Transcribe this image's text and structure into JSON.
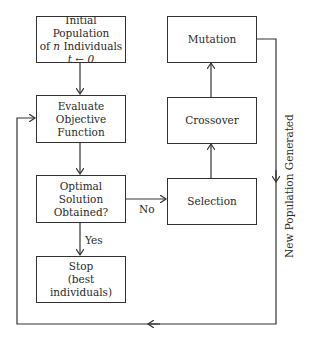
{
  "diagram": {
    "type": "flowchart",
    "nodes": {
      "init": {
        "line1": "Initial Population",
        "line2_prefix": "of ",
        "line2_var": "n",
        "line2_suffix": " Individuals",
        "line3": "t ← 0"
      },
      "evaluate": {
        "line1": "Evaluate Objective",
        "line2": "Function"
      },
      "decision": {
        "line1": "Optimal Solution",
        "line2": "Obtained?"
      },
      "stop": {
        "line1": "Stop",
        "line2": "(best individuals)"
      },
      "selection": {
        "label": "Selection"
      },
      "crossover": {
        "label": "Crossover"
      },
      "mutation": {
        "label": "Mutation"
      }
    },
    "edge_labels": {
      "no": "No",
      "yes": "Yes",
      "loop": "New Population Generated"
    },
    "edges": [
      {
        "from": "init",
        "to": "evaluate"
      },
      {
        "from": "evaluate",
        "to": "decision"
      },
      {
        "from": "decision",
        "to": "stop",
        "label": "Yes"
      },
      {
        "from": "decision",
        "to": "selection",
        "label": "No"
      },
      {
        "from": "selection",
        "to": "crossover"
      },
      {
        "from": "crossover",
        "to": "mutation"
      },
      {
        "from": "mutation",
        "to": "evaluate",
        "label": "New Population Generated"
      }
    ],
    "colors": {
      "stroke": "#333333",
      "text": "#2a2a2a",
      "background": "#ffffff"
    }
  }
}
